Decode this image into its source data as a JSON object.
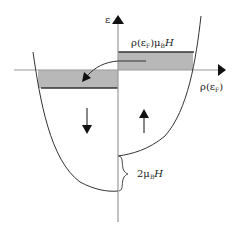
{
  "diagram": {
    "type": "density-of-states-spin-split",
    "axes": {
      "y_label": "ε",
      "x_label_main": "ρ(ε",
      "x_label_sub": "F",
      "x_label_close": ")"
    },
    "top_label": {
      "prefix": "ρ(ε",
      "sub1": "F",
      "mid": ")μ",
      "sub2": "B",
      "suffix": "H"
    },
    "gap_label": {
      "prefix": "2μ",
      "sub": "B",
      "suffix": "H"
    },
    "spin_down_arrow": "down",
    "spin_up_arrow": "up",
    "colors": {
      "axis": "#9a9a9a",
      "curve": "#333333",
      "shade": "#b5b5b5",
      "box_edge": "#333333",
      "arrow": "#111111"
    }
  }
}
